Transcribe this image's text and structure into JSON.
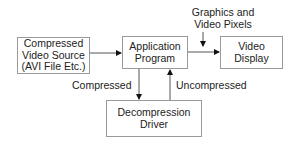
{
  "diagram": {
    "nodes": {
      "source": {
        "line1": "Compressed",
        "line2": "Video Source",
        "line3": "(AVI File Etc.)"
      },
      "app": {
        "line1": "Application",
        "line2": "Program"
      },
      "display": {
        "line1": "Video",
        "line2": "Display"
      },
      "driver": {
        "line1": "Decompression",
        "line2": "Driver"
      }
    },
    "labels": {
      "graphics_line1": "Graphics and",
      "graphics_line2": "Video Pixels",
      "compressed": "Compressed",
      "uncompressed": "Uncompressed"
    },
    "edges": [
      {
        "from": "source",
        "to": "app"
      },
      {
        "from": "app",
        "to": "display"
      },
      {
        "from": "graphics-input",
        "to": "app-display-edge"
      },
      {
        "from": "app",
        "to": "driver",
        "label": "Compressed"
      },
      {
        "from": "driver",
        "to": "app",
        "label": "Uncompressed"
      }
    ]
  }
}
